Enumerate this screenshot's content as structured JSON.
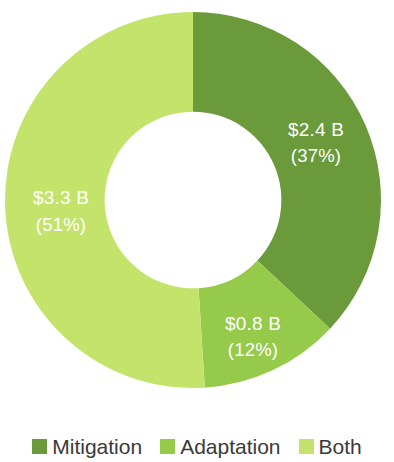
{
  "chart_data": {
    "type": "pie",
    "variant": "donut",
    "title": "",
    "subtitle": "",
    "xlabel": "",
    "ylabel": "",
    "grid": false,
    "legend_position": "bottom",
    "hole_ratio": 0.47,
    "start_angle_deg": 0,
    "direction": "clockwise",
    "unit": "$ billions",
    "categories": [
      "Mitigation",
      "Adaptation",
      "Both"
    ],
    "values": [
      2.4,
      0.8,
      3.3
    ],
    "percentages": [
      37,
      12,
      51
    ],
    "colors": [
      "#6a9a3a",
      "#96ca4a",
      "#c3e36a"
    ],
    "value_labels": [
      "$2.4 B",
      "$0.8 B",
      "$3.3 B"
    ],
    "percent_labels": [
      "(37%)",
      "(12%)",
      "(51%)"
    ],
    "label_color": "#ffffff",
    "slices": [
      {
        "name": "Mitigation",
        "value": 2.4,
        "percent": 37,
        "color": "#6a9a3a",
        "value_label": "$2.4 B",
        "percent_label": "(37%)",
        "label_x": 316,
        "label_y": 136,
        "pct_x": 316,
        "pct_y": 162
      },
      {
        "name": "Adaptation",
        "value": 0.8,
        "percent": 12,
        "color": "#96ca4a",
        "value_label": "$0.8 B",
        "percent_label": "(12%)",
        "label_x": 253,
        "label_y": 330,
        "pct_x": 253,
        "pct_y": 356
      },
      {
        "name": "Both",
        "value": 3.3,
        "percent": 51,
        "color": "#c3e36a",
        "value_label": "$3.3 B",
        "percent_label": "(51%)",
        "label_x": 61,
        "label_y": 204,
        "pct_x": 61,
        "pct_y": 231
      }
    ]
  },
  "legend": {
    "items": [
      {
        "label": "Mitigation",
        "color": "#6a9a3a"
      },
      {
        "label": "Adaptation",
        "color": "#96ca4a"
      },
      {
        "label": "Both",
        "color": "#c3e36a"
      }
    ]
  }
}
